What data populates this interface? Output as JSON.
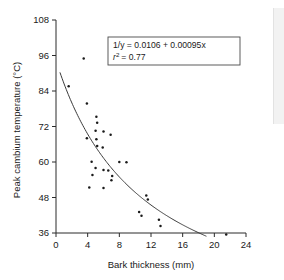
{
  "chart_data": {
    "type": "scatter",
    "title": "",
    "xlabel": "Bark thickness (mm)",
    "ylabel": "Peak cambium temperature (°C)",
    "xlim": [
      0,
      24
    ],
    "ylim": [
      36,
      108
    ],
    "xticks": [
      0,
      4,
      8,
      12,
      16,
      20,
      24
    ],
    "yticks": [
      36,
      48,
      60,
      72,
      84,
      96,
      108
    ],
    "xtick_labels": [
      "0",
      "4",
      "8",
      "12",
      "16",
      "20",
      "24"
    ],
    "ytick_labels": [
      "36",
      "48",
      "60",
      "72",
      "84",
      "96",
      "108"
    ],
    "grid": false,
    "legend": false,
    "annotation_box": {
      "line1": "1/y = 0.0106 + 0.00095x",
      "line2": "r² = 0.77",
      "line2_symbol": "r",
      "line2_exponent": "2",
      "line2_value": "= 0.77"
    },
    "series": [
      {
        "name": "observations",
        "marker": "dot",
        "color": "#1a1a1a",
        "points": [
          [
            3.5,
            95.0
          ],
          [
            1.6,
            85.6
          ],
          [
            3.9,
            79.8
          ],
          [
            5.1,
            75.3
          ],
          [
            5.2,
            73.3
          ],
          [
            5.0,
            70.6
          ],
          [
            6.0,
            70.3
          ],
          [
            6.9,
            69.2
          ],
          [
            3.9,
            68.0
          ],
          [
            5.1,
            67.7
          ],
          [
            5.2,
            65.4
          ],
          [
            5.9,
            64.9
          ],
          [
            4.5,
            60.1
          ],
          [
            8.0,
            60.0
          ],
          [
            8.9,
            59.9
          ],
          [
            5.0,
            58.0
          ],
          [
            6.0,
            57.3
          ],
          [
            6.6,
            57.1
          ],
          [
            4.6,
            55.6
          ],
          [
            7.1,
            55.3
          ],
          [
            7.0,
            53.8
          ],
          [
            4.2,
            51.4
          ],
          [
            6.0,
            51.2
          ],
          [
            11.4,
            48.7
          ],
          [
            11.6,
            47.3
          ],
          [
            10.5,
            43.1
          ],
          [
            10.8,
            41.8
          ],
          [
            13.0,
            40.5
          ],
          [
            13.2,
            38.4
          ],
          [
            21.5,
            35.5
          ]
        ]
      }
    ],
    "fit_curve": {
      "name": "fitted hyperbolic curve",
      "model": "1/y = 0.0106 + 0.00095x",
      "intercept": 0.0106,
      "slope": 0.00095,
      "r_squared": 0.77,
      "x_start": 0.5,
      "x_end": 19.0
    }
  }
}
